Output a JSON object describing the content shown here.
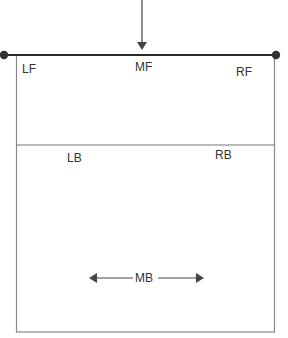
{
  "diagram": {
    "type": "volleyball-court-positions",
    "colors": {
      "net": "#2a2a2a",
      "court_line": "#888888",
      "arrow": "#444444",
      "text": "#333333",
      "background": "#ffffff"
    },
    "positions": {
      "lf": "LF",
      "mf": "MF",
      "rf": "RF",
      "lb": "LB",
      "rb": "RB",
      "mb": "MB"
    },
    "arrows": {
      "incoming": "down-arrow-to-net",
      "mb_movement": "left-right-double-arrow"
    }
  }
}
